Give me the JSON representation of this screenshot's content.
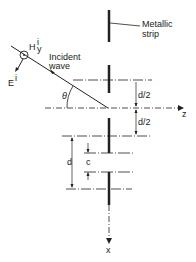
{
  "labels": {
    "metallic_strip_line1": "Metallic",
    "metallic_strip_line2": "strip",
    "incident_line1": "Incident",
    "incident_line2": "wave",
    "h_field": "H",
    "h_sup": "i",
    "h_sub": "y",
    "e_field": "E",
    "e_sup": "i",
    "theta": "θ",
    "d_half_top": "d/2",
    "d_half_bottom": "d/2",
    "d": "d",
    "c": "c",
    "z_axis": "z",
    "x_axis": "x"
  },
  "colors": {
    "ink": "#222222",
    "background": "#ffffff"
  }
}
